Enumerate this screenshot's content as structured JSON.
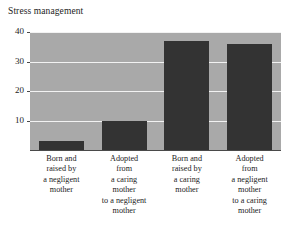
{
  "chart_data": {
    "type": "bar",
    "title": "Stress management",
    "xlabel": "",
    "ylabel": "",
    "ylim": [
      0,
      40
    ],
    "yticks": [
      10,
      20,
      30,
      40
    ],
    "grid": true,
    "legend": "none",
    "categories": [
      "Born and raised by a negligent mother",
      "Adopted from a caring mother to a negligent mother",
      "Born and raised by a caring mother",
      "Adopted from a negligent mother to a caring mother"
    ],
    "category_lines": [
      [
        "Born and",
        "raised by",
        "a negligent",
        "mother"
      ],
      [
        "Adopted",
        "from",
        "a caring",
        "mother",
        "to a negligent",
        "mother"
      ],
      [
        "Born and",
        "raised by",
        "a caring",
        "mother"
      ],
      [
        "Adopted",
        "from",
        "a negligent",
        "mother",
        "to a caring",
        "mother"
      ]
    ],
    "values": [
      3,
      10,
      37,
      36
    ],
    "bar_color": "#333333",
    "plot_background": "#a9a9a9",
    "gridline_color": "#f2f2f2",
    "axis_color": "#4a4a4a"
  }
}
